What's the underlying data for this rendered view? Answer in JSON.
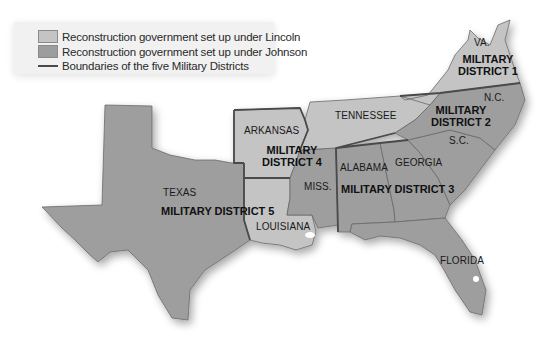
{
  "legend": {
    "items": [
      {
        "label": "Reconstruction government set up under Lincoln",
        "type": "swatch",
        "color": "#c4c4c4"
      },
      {
        "label": "Reconstruction government set up under Johnson",
        "type": "swatch",
        "color": "#9d9d9d"
      },
      {
        "label": "Boundaries of the five Military Districts",
        "type": "line",
        "color": "#4a4a4a"
      }
    ]
  },
  "colors": {
    "lincoln": "#c4c4c4",
    "johnson": "#9e9e9e",
    "boundary": "#4a4a4a",
    "background": "#ffffff"
  },
  "states": {
    "va": "VA.",
    "nc": "N.C.",
    "sc": "S.C.",
    "tennessee": "TENNESSEE",
    "arkansas": "ARKANSAS",
    "alabama": "ALABAMA",
    "georgia": "GEORGIA",
    "miss": "MISS.",
    "texas": "TEXAS",
    "louisiana": "LOUISIANA",
    "florida": "FLORIDA"
  },
  "districts": {
    "d1_line1": "MILITARY",
    "d1_line2": "DISTRICT 1",
    "d2_line1": "MILITARY",
    "d2_line2": "DISTRICT 2",
    "d3": "MILITARY DISTRICT 3",
    "d4_line1": "MILITARY",
    "d4_line2": "DISTRICT 4",
    "d5": "MILITARY DISTRICT 5"
  }
}
